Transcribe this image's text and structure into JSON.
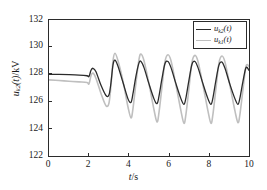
{
  "chart_data": {
    "type": "line",
    "title": "",
    "xlabel": "t/s",
    "ylabel": "u_k2(t)/kV",
    "xlim": [
      0,
      10
    ],
    "ylim": [
      122,
      132
    ],
    "xticks": [
      0,
      2,
      4,
      6,
      8,
      10
    ],
    "yticks": [
      122,
      124,
      126,
      128,
      130,
      132
    ],
    "grid": false,
    "legend_position": "top-right",
    "series": [
      {
        "name": "u_k2(t)",
        "color": "#2b2b2b",
        "linewidth": 1.3,
        "description": "Steady at 128 kV until t=2 s, then damped-growing oscillation settling to roughly 125.8-129.0 kV band with about 1.0 s period",
        "steady_value": 128.0,
        "disturbance_start": 2.0,
        "period": 1.0,
        "settled_peak": 129.0,
        "settled_trough": 125.8,
        "points": [
          [
            0.0,
            128.0
          ],
          [
            0.5,
            128.0
          ],
          [
            1.0,
            127.98
          ],
          [
            1.5,
            127.95
          ],
          [
            1.9,
            127.9
          ],
          [
            2.0,
            127.85
          ],
          [
            2.1,
            128.3
          ],
          [
            2.2,
            128.45
          ],
          [
            2.35,
            128.2
          ],
          [
            2.6,
            127.2
          ],
          [
            2.85,
            126.45
          ],
          [
            3.0,
            126.5
          ],
          [
            3.1,
            127.4
          ],
          [
            3.2,
            128.7
          ],
          [
            3.3,
            129.05
          ],
          [
            3.45,
            128.6
          ],
          [
            3.7,
            127.4
          ],
          [
            3.95,
            126.2
          ],
          [
            4.1,
            125.95
          ],
          [
            4.2,
            126.6
          ],
          [
            4.35,
            127.9
          ],
          [
            4.5,
            128.85
          ],
          [
            4.6,
            128.95
          ],
          [
            4.75,
            128.5
          ],
          [
            5.0,
            127.3
          ],
          [
            5.25,
            126.2
          ],
          [
            5.4,
            125.85
          ],
          [
            5.5,
            126.4
          ],
          [
            5.65,
            127.7
          ],
          [
            5.8,
            128.8
          ],
          [
            5.95,
            128.95
          ],
          [
            6.1,
            128.5
          ],
          [
            6.35,
            127.3
          ],
          [
            6.6,
            126.2
          ],
          [
            6.75,
            125.8
          ],
          [
            6.85,
            126.3
          ],
          [
            7.0,
            127.6
          ],
          [
            7.15,
            128.75
          ],
          [
            7.3,
            128.95
          ],
          [
            7.45,
            128.5
          ],
          [
            7.7,
            127.3
          ],
          [
            7.95,
            126.2
          ],
          [
            8.1,
            125.8
          ],
          [
            8.2,
            126.3
          ],
          [
            8.35,
            127.6
          ],
          [
            8.5,
            128.7
          ],
          [
            8.65,
            128.9
          ],
          [
            8.8,
            128.45
          ],
          [
            9.05,
            127.25
          ],
          [
            9.3,
            126.2
          ],
          [
            9.45,
            125.8
          ],
          [
            9.55,
            126.3
          ],
          [
            9.7,
            127.5
          ],
          [
            9.85,
            128.5
          ],
          [
            10.0,
            128.3
          ]
        ]
      },
      {
        "name": "u_k1(t)",
        "color": "#bfbfbf",
        "linewidth": 1.6,
        "description": "Steady near 127.5 kV until t=2 s, then larger-amplitude oscillation spanning roughly 124.4-129.6 kV with about 1.0 s period",
        "steady_value": 127.5,
        "disturbance_start": 2.0,
        "period": 1.0,
        "settled_peak": 129.5,
        "settled_trough": 124.4,
        "points": [
          [
            0.0,
            127.6
          ],
          [
            0.5,
            127.55
          ],
          [
            1.0,
            127.5
          ],
          [
            1.5,
            127.45
          ],
          [
            1.9,
            127.4
          ],
          [
            2.0,
            127.3
          ],
          [
            2.1,
            127.9
          ],
          [
            2.2,
            128.1
          ],
          [
            2.35,
            127.7
          ],
          [
            2.6,
            126.6
          ],
          [
            2.85,
            125.7
          ],
          [
            3.0,
            125.9
          ],
          [
            3.1,
            127.2
          ],
          [
            3.2,
            129.0
          ],
          [
            3.3,
            129.55
          ],
          [
            3.45,
            129.0
          ],
          [
            3.7,
            127.5
          ],
          [
            3.95,
            125.6
          ],
          [
            4.1,
            124.8
          ],
          [
            4.2,
            125.5
          ],
          [
            4.35,
            127.4
          ],
          [
            4.5,
            129.1
          ],
          [
            4.6,
            129.5
          ],
          [
            4.75,
            129.0
          ],
          [
            5.0,
            127.3
          ],
          [
            5.25,
            125.4
          ],
          [
            5.4,
            124.5
          ],
          [
            5.5,
            125.2
          ],
          [
            5.65,
            127.1
          ],
          [
            5.8,
            128.95
          ],
          [
            5.95,
            129.45
          ],
          [
            6.1,
            129.0
          ],
          [
            6.35,
            127.2
          ],
          [
            6.6,
            125.3
          ],
          [
            6.75,
            124.4
          ],
          [
            6.85,
            125.1
          ],
          [
            7.0,
            127.0
          ],
          [
            7.15,
            128.9
          ],
          [
            7.3,
            129.4
          ],
          [
            7.45,
            128.95
          ],
          [
            7.7,
            127.2
          ],
          [
            7.95,
            125.3
          ],
          [
            8.1,
            124.4
          ],
          [
            8.2,
            125.1
          ],
          [
            8.35,
            127.0
          ],
          [
            8.5,
            128.85
          ],
          [
            8.65,
            129.35
          ],
          [
            8.8,
            128.9
          ],
          [
            9.05,
            127.15
          ],
          [
            9.3,
            125.3
          ],
          [
            9.45,
            124.45
          ],
          [
            9.55,
            125.1
          ],
          [
            9.7,
            126.9
          ],
          [
            9.85,
            128.6
          ],
          [
            10.0,
            128.6
          ]
        ]
      }
    ]
  },
  "axes": {
    "ylabel_var": "u",
    "ylabel_sub": "k2",
    "ylabel_arg": "(t)",
    "ylabel_unit": "/kV",
    "xlabel_var": "t",
    "xlabel_unit": "/s",
    "xtick_labels": [
      "0",
      "2",
      "4",
      "6",
      "8",
      "10"
    ],
    "ytick_labels": [
      "122",
      "124",
      "126",
      "128",
      "130",
      "132"
    ]
  },
  "legend": {
    "entries": [
      {
        "var": "u",
        "sub": "k2",
        "arg": "(t)",
        "color": "#2b2b2b"
      },
      {
        "var": "u",
        "sub": "k1",
        "arg": "(t)",
        "color": "#bfbfbf"
      }
    ]
  }
}
